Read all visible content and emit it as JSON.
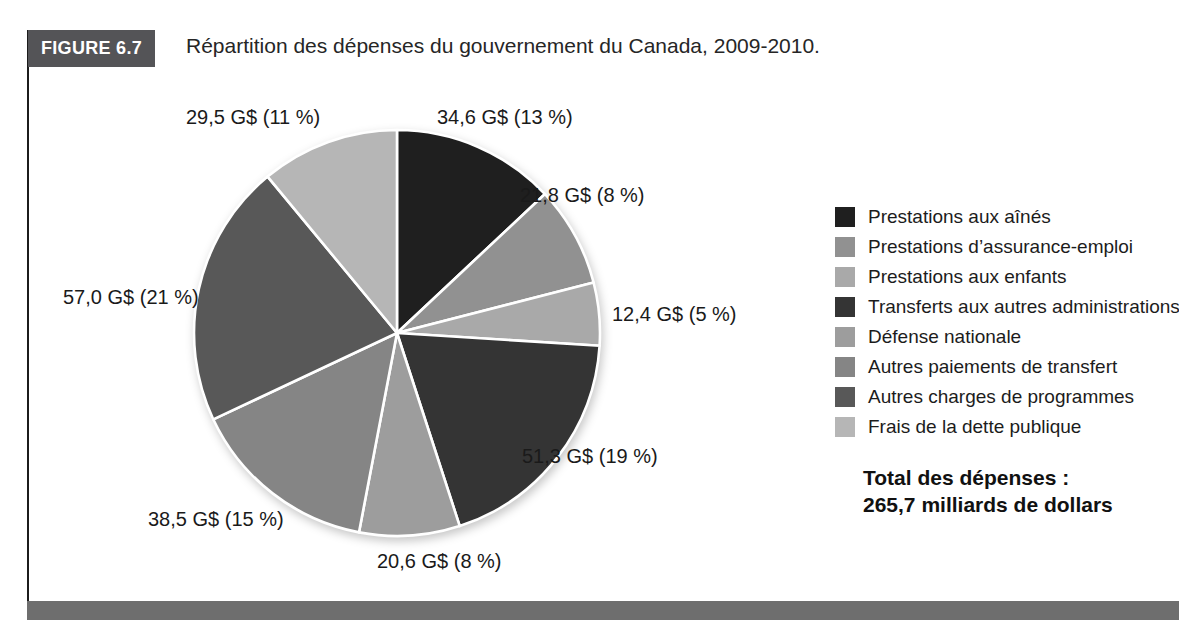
{
  "figure": {
    "tag": "FIGURE 6.7",
    "title": "Répartition des dépenses du gouvernement du Canada, 2009-2010."
  },
  "chart_data": {
    "type": "pie",
    "title": "Répartition des dépenses du gouvernement du Canada, 2009-2010",
    "unit": "G$ (milliards de dollars)",
    "start_angle_deg": 0,
    "direction": "clockwise",
    "legend_position": "right",
    "slices": [
      {
        "label": "Prestations aux aînés",
        "value": 34.6,
        "pct": 13,
        "callout": "34,6 G$ (13 %)",
        "color": "#1f1f1f"
      },
      {
        "label": "Prestations d’assurance-emploi",
        "value": 21.8,
        "pct": 8,
        "callout": "21,8 G$ (8 %)",
        "color": "#919191"
      },
      {
        "label": "Prestations aux enfants",
        "value": 12.4,
        "pct": 5,
        "callout": "12,4 G$ (5 %)",
        "color": "#a9a9a9"
      },
      {
        "label": "Transferts aux autres administrations",
        "value": 51.3,
        "pct": 19,
        "callout": "51,3 G$ (19 %)",
        "color": "#343434"
      },
      {
        "label": "Défense nationale",
        "value": 20.6,
        "pct": 8,
        "callout": "20,6 G$ (8 %)",
        "color": "#9d9d9d"
      },
      {
        "label": "Autres paiements de transfert",
        "value": 38.5,
        "pct": 15,
        "callout": "38,5 G$ (15 %)",
        "color": "#858585"
      },
      {
        "label": "Autres charges de programmes",
        "value": 57.0,
        "pct": 21,
        "callout": "57,0 G$ (21 %)",
        "color": "#585858"
      },
      {
        "label": "Frais de la dette publique",
        "value": 29.5,
        "pct": 11,
        "callout": "29,5 G$ (11 %)",
        "color": "#b6b6b6"
      }
    ],
    "total": {
      "label": "Total des dépenses :",
      "value_text": "265,7 milliards de dollars",
      "value_numeric": 265.7
    }
  }
}
